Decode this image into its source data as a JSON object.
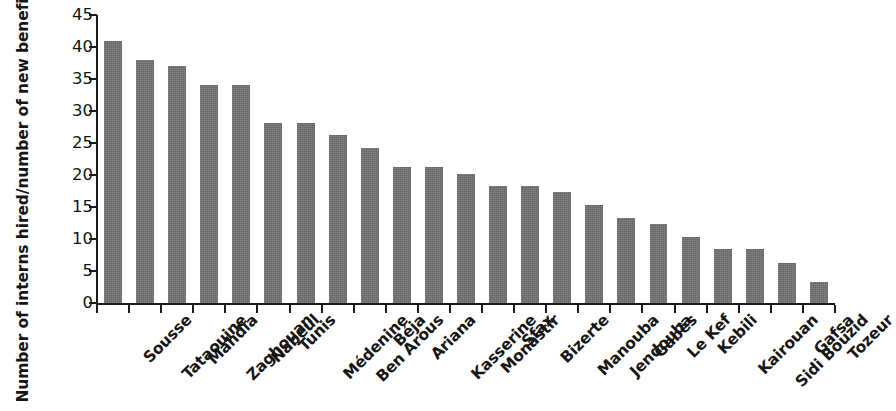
{
  "chart_data": {
    "type": "bar",
    "title": "",
    "subtitle": "",
    "xlabel": "",
    "ylabel": "Number of interns hired/number of new beneficiaries (%)",
    "ylim": [
      0,
      45
    ],
    "yticks": [
      0,
      5,
      10,
      15,
      20,
      25,
      30,
      35,
      40,
      45
    ],
    "ytick_labels": [
      "0",
      "5",
      "10",
      "15",
      "20",
      "25",
      "30",
      "35",
      "40",
      "45"
    ],
    "grid": false,
    "legend": null,
    "bar_color": "#727272",
    "axis_color": "#1a1a1a",
    "categories": [
      "Sousse",
      "Tataouine",
      "Mahdia",
      "Zaghouan",
      "Nabeul",
      "Tunis",
      "Médenine",
      "Ben Arous",
      "Béja",
      "Ariana",
      "Kasserine",
      "Monastir",
      "Sfax",
      "Bizerte",
      "Manouba",
      "Jendouba",
      "Gabès",
      "Le Kef",
      "Kebili",
      "Kairouan",
      "Sidi Bouzid",
      "Gafsa",
      "Tozeur"
    ],
    "values": [
      41.0,
      38.0,
      37.0,
      34.1,
      34.1,
      28.2,
      28.2,
      26.2,
      24.2,
      21.2,
      21.2,
      20.2,
      18.3,
      18.3,
      17.3,
      15.3,
      13.3,
      12.3,
      10.3,
      8.4,
      8.4,
      6.3,
      3.3
    ]
  }
}
